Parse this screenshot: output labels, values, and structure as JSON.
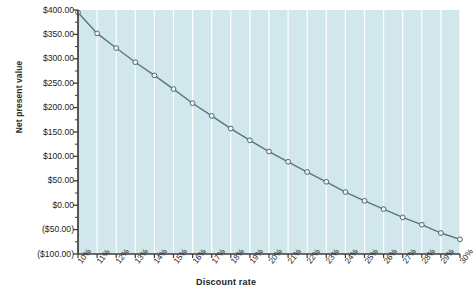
{
  "chart_data": {
    "type": "line",
    "title": "",
    "xlabel": "Discount rate",
    "ylabel": "Net present value",
    "categories": [
      "10%",
      "11%",
      "12%",
      "13%",
      "14%",
      "15%",
      "16%",
      "17%",
      "18%",
      "19%",
      "20%",
      "21%",
      "22%",
      "23%",
      "24%",
      "25%",
      "26%",
      "27%",
      "28%",
      "29%",
      "30%"
    ],
    "x": [
      10,
      11,
      12,
      13,
      14,
      15,
      16,
      17,
      18,
      19,
      20,
      21,
      22,
      23,
      24,
      25,
      26,
      27,
      28,
      29,
      30
    ],
    "values": [
      395.0,
      352.0,
      322.0,
      293.0,
      266.0,
      238.0,
      209.0,
      183.0,
      157.0,
      133.0,
      110.0,
      89.0,
      68.0,
      48.0,
      27.0,
      9.0,
      -8.0,
      -25.0,
      -40.0,
      -57.0,
      -70.0
    ],
    "ytick_labels": [
      "$400.00",
      "$350.00",
      "$300.00",
      "$250.00",
      "$200.00",
      "$150.00",
      "$100.00",
      "$50.00",
      "$0.00",
      "($50.00)",
      "($100.00)"
    ],
    "ytick_values": [
      400,
      350,
      300,
      250,
      200,
      150,
      100,
      50,
      0,
      -50,
      -100
    ],
    "ylim": [
      -100,
      400
    ],
    "xlim": [
      10,
      30
    ],
    "grid": "vertical-only",
    "gridline_color": "#ffffff",
    "plot_background": "#d2e7ec",
    "line_color": "#55777f",
    "marker_face_color": "#eef6f8",
    "marker_edge_color": "#4a6a72",
    "axis_color": "#3c3c3c",
    "legend": "none"
  }
}
